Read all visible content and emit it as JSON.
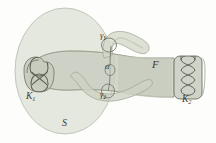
{
  "figure": {
    "type": "topology-diagram",
    "width": 216,
    "height": 143,
    "background_color": "#fdfdfb",
    "labels": {
      "surface": "S",
      "fiber_surface": "F",
      "knot_left": "K",
      "knot_left_sub": "1",
      "knot_right": "K",
      "knot_right_sub": "2",
      "curve_top": "γ",
      "curve_top_sub": "1",
      "curve_bottom": "γ",
      "curve_bottom_sub": "2",
      "arc_center": "α"
    },
    "colors": {
      "ellipse_fill": "#e3e6dc",
      "ellipse_stroke": "#b9bdb0",
      "band_fill": "#c9cec1",
      "band_stroke": "#9ea494",
      "tube_fill": "#cfd4c7",
      "tube_stroke": "#a3a999",
      "knot_fill": "#c4c9bb",
      "knot_stroke": "#6f7366",
      "label_color": "#3a3a36"
    },
    "elements": [
      {
        "name": "surface-ellipse",
        "shape": "ellipse",
        "cx": 65,
        "cy": 71,
        "rx": 50,
        "ry": 63
      },
      {
        "name": "knot-k1-blob",
        "shape": "rounded-blob",
        "x": 22,
        "y": 58,
        "w": 34,
        "h": 36
      },
      {
        "name": "knot-k1-diagram",
        "shape": "figure-eight-knot",
        "crossings": 2
      },
      {
        "name": "fiber-band",
        "shape": "horizontal-band",
        "x1": 30,
        "y1": 50,
        "x2": 200,
        "y2": 92
      },
      {
        "name": "knot-k2-box",
        "shape": "rounded-rect",
        "x": 173,
        "y": 55,
        "w": 30,
        "h": 45
      },
      {
        "name": "knot-k2-diagram",
        "shape": "braid",
        "crossings": 3
      },
      {
        "name": "curve-gamma1-tube",
        "shape": "finger-tube",
        "direction": "up-right"
      },
      {
        "name": "curve-gamma2-tube",
        "shape": "u-tube",
        "direction": "down"
      }
    ]
  }
}
